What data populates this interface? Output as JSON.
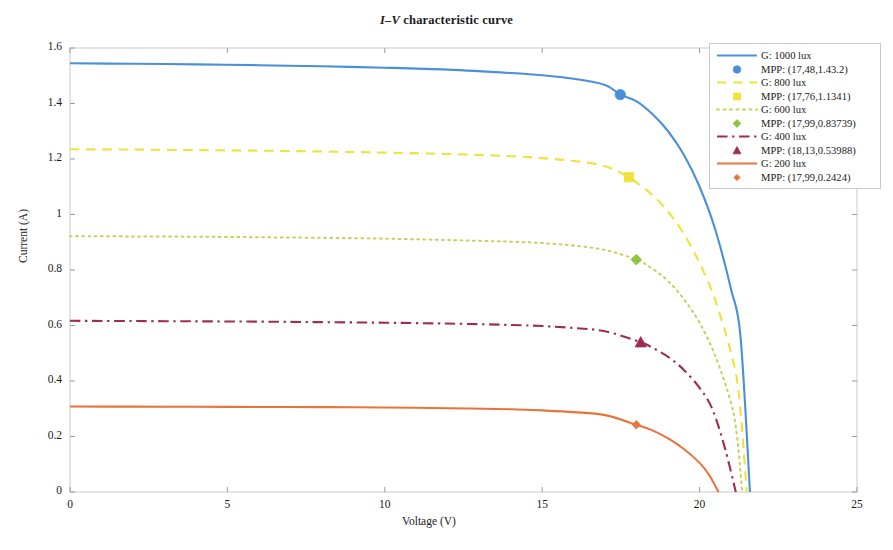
{
  "chart_data": {
    "type": "line",
    "title": "I–V characteristic curve",
    "title_italic_part": "I–V",
    "title_rest": " characteristic curve",
    "xlabel": "Voltage (V)",
    "ylabel": "Current (A)",
    "xlim": [
      0,
      25
    ],
    "ylim": [
      0,
      1.6
    ],
    "xticks": [
      0,
      5,
      10,
      15,
      20,
      25
    ],
    "xtick_labels": [
      "0",
      "5",
      "10",
      "15",
      "20",
      "25"
    ],
    "yticks": [
      0,
      0.2,
      0.4,
      0.6,
      0.8,
      1.0,
      1.2,
      1.4,
      1.6
    ],
    "ytick_labels": [
      "0",
      "0.2",
      "0.4",
      "0.6",
      "0.8",
      "1",
      "1.2",
      "1.4",
      "1.6"
    ],
    "grid": false,
    "legend_position": "upper right",
    "series": [
      {
        "name": "G: 1000 lux",
        "color": "#4a90d9",
        "linestyle": "solid",
        "marker": "circle",
        "isc": 1.545,
        "voc": 21.6,
        "mpp_label": "MPP: (17,48,1.43.2)",
        "mpp_v": 17.48,
        "mpp_i": 1.432,
        "points": [
          [
            0,
            1.545
          ],
          [
            2,
            1.543
          ],
          [
            4,
            1.541
          ],
          [
            6,
            1.538
          ],
          [
            8,
            1.534
          ],
          [
            10,
            1.529
          ],
          [
            12,
            1.522
          ],
          [
            14,
            1.51
          ],
          [
            15,
            1.502
          ],
          [
            16,
            1.489
          ],
          [
            17,
            1.467
          ],
          [
            17.48,
            1.432
          ],
          [
            18,
            1.408
          ],
          [
            18.5,
            1.362
          ],
          [
            19,
            1.3
          ],
          [
            19.5,
            1.215
          ],
          [
            20,
            1.1
          ],
          [
            20.5,
            0.945
          ],
          [
            21,
            0.73
          ],
          [
            21.3,
            0.56
          ],
          [
            21.6,
            0.0
          ]
        ]
      },
      {
        "name": "G: 800 lux",
        "color": "#f2e13c",
        "linestyle": "dashed",
        "marker": "square",
        "isc": 1.235,
        "voc": 21.5,
        "mpp_label": "MPP: (17,76,1.1341)",
        "mpp_v": 17.76,
        "mpp_i": 1.1341,
        "points": [
          [
            0,
            1.235
          ],
          [
            2,
            1.234
          ],
          [
            4,
            1.232
          ],
          [
            6,
            1.23
          ],
          [
            8,
            1.227
          ],
          [
            10,
            1.223
          ],
          [
            12,
            1.218
          ],
          [
            14,
            1.21
          ],
          [
            15,
            1.203
          ],
          [
            16,
            1.193
          ],
          [
            17,
            1.174
          ],
          [
            17.76,
            1.1341
          ],
          [
            18,
            1.115
          ],
          [
            18.5,
            1.07
          ],
          [
            19,
            1.01
          ],
          [
            19.5,
            0.93
          ],
          [
            20,
            0.825
          ],
          [
            20.5,
            0.69
          ],
          [
            21,
            0.5
          ],
          [
            21.25,
            0.35
          ],
          [
            21.5,
            0.0
          ]
        ]
      },
      {
        "name": "G: 600 lux",
        "color": "#c8cf5a",
        "linestyle": "dotted",
        "marker": "diamond",
        "isc": 0.922,
        "voc": 21.35,
        "mpp_label": "MPP: (17,99,0.83739)",
        "mpp_v": 17.99,
        "mpp_i": 0.83739,
        "points": [
          [
            0,
            0.922
          ],
          [
            2,
            0.921
          ],
          [
            4,
            0.92
          ],
          [
            6,
            0.918
          ],
          [
            8,
            0.916
          ],
          [
            10,
            0.913
          ],
          [
            12,
            0.908
          ],
          [
            14,
            0.902
          ],
          [
            15,
            0.897
          ],
          [
            16,
            0.888
          ],
          [
            17,
            0.872
          ],
          [
            17.99,
            0.8374
          ],
          [
            18.5,
            0.805
          ],
          [
            19,
            0.76
          ],
          [
            19.5,
            0.695
          ],
          [
            20,
            0.61
          ],
          [
            20.5,
            0.49
          ],
          [
            21,
            0.32
          ],
          [
            21.2,
            0.19
          ],
          [
            21.35,
            0.0
          ]
        ]
      },
      {
        "name": "G: 400 lux",
        "color": "#a02c52",
        "linestyle": "dashdot",
        "marker": "triangle",
        "isc": 0.617,
        "voc": 21.15,
        "mpp_label": "MPP: (18,13,0.53988)",
        "mpp_v": 18.13,
        "mpp_i": 0.53988,
        "points": [
          [
            0,
            0.617
          ],
          [
            2,
            0.616
          ],
          [
            4,
            0.615
          ],
          [
            6,
            0.614
          ],
          [
            8,
            0.612
          ],
          [
            10,
            0.61
          ],
          [
            12,
            0.607
          ],
          [
            14,
            0.602
          ],
          [
            15,
            0.598
          ],
          [
            16,
            0.591
          ],
          [
            17,
            0.579
          ],
          [
            18.13,
            0.5399
          ],
          [
            18.5,
            0.52
          ],
          [
            19,
            0.487
          ],
          [
            19.5,
            0.44
          ],
          [
            20,
            0.375
          ],
          [
            20.4,
            0.3
          ],
          [
            20.8,
            0.16
          ],
          [
            21.15,
            0.0
          ]
        ]
      },
      {
        "name": "G: 200 lux",
        "color": "#e8743b",
        "linestyle": "solid",
        "marker": "diamond-small",
        "isc": 0.308,
        "voc": 20.6,
        "mpp_label": "MPP: (17,99,0.2424)",
        "mpp_v": 17.99,
        "mpp_i": 0.2424,
        "points": [
          [
            0,
            0.308
          ],
          [
            2,
            0.3075
          ],
          [
            4,
            0.307
          ],
          [
            6,
            0.3065
          ],
          [
            8,
            0.306
          ],
          [
            10,
            0.3045
          ],
          [
            12,
            0.302
          ],
          [
            14,
            0.298
          ],
          [
            15,
            0.294
          ],
          [
            16,
            0.288
          ],
          [
            17,
            0.277
          ],
          [
            17.99,
            0.2424
          ],
          [
            18.5,
            0.222
          ],
          [
            19,
            0.193
          ],
          [
            19.5,
            0.155
          ],
          [
            20,
            0.105
          ],
          [
            20.3,
            0.062
          ],
          [
            20.6,
            0.0
          ]
        ]
      }
    ],
    "legend_entries": [
      {
        "label": "G: 1000 lux",
        "kind": "line",
        "color": "#4a90d9",
        "linestyle": "solid"
      },
      {
        "label": "MPP: (17,48,1.43.2)",
        "kind": "marker",
        "color": "#4a90d9",
        "marker": "circle"
      },
      {
        "label": "G: 800 lux",
        "kind": "line",
        "color": "#f2e13c",
        "linestyle": "dashed"
      },
      {
        "label": "MPP: (17,76,1.1341)",
        "kind": "marker",
        "color": "#f2e13c",
        "marker": "square"
      },
      {
        "label": "G: 600 lux",
        "kind": "line",
        "color": "#c8cf5a",
        "linestyle": "dotted"
      },
      {
        "label": "MPP: (17,99,0.83739)",
        "kind": "marker",
        "color": "#8cc63f",
        "marker": "diamond"
      },
      {
        "label": "G: 400 lux",
        "kind": "line",
        "color": "#a02c52",
        "linestyle": "dashdot"
      },
      {
        "label": "MPP: (18,13,0.53988)",
        "kind": "marker",
        "color": "#a02c52",
        "marker": "triangle"
      },
      {
        "label": "G: 200 lux",
        "kind": "line",
        "color": "#e8743b",
        "linestyle": "solid"
      },
      {
        "label": "MPP: (17,99,0.2424)",
        "kind": "marker",
        "color": "#e8743b",
        "marker": "diamond-small"
      }
    ]
  },
  "axes": {
    "frame_color": "#c9c9c9"
  }
}
